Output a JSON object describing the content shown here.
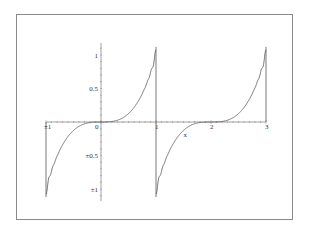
{
  "chart_data": {
    "type": "line",
    "title": "",
    "xlabel": "x",
    "ylabel": "",
    "xlim": [
      -1,
      3
    ],
    "ylim": [
      -1.15,
      1.15
    ],
    "grid": false,
    "legend": null,
    "x_ticks": [
      {
        "value": -1,
        "label": "±1"
      },
      {
        "value": 0,
        "label": "0"
      },
      {
        "value": 1,
        "label": "1"
      },
      {
        "value": 2,
        "label": "2"
      },
      {
        "value": 3,
        "label": "3"
      }
    ],
    "y_ticks": [
      {
        "value": 1,
        "label": "1"
      },
      {
        "value": 0.5,
        "label": "0.5"
      },
      {
        "value": -0.5,
        "label": "±0.5"
      },
      {
        "value": -1,
        "label": "±1"
      }
    ],
    "series": [
      {
        "name": "Fourier approximation of periodic x^3 (period 2)",
        "color": "#555555",
        "description": "Periodic extension of f(x)=x^3 on [-1,1) with Gibbs overshoot near odd integers",
        "x": [
          -1.0,
          -0.9,
          -0.8,
          -0.7,
          -0.6,
          -0.5,
          -0.4,
          -0.3,
          -0.2,
          -0.1,
          0.0,
          0.1,
          0.2,
          0.3,
          0.4,
          0.5,
          0.6,
          0.7,
          0.8,
          0.9,
          1.0,
          1.1,
          1.2,
          1.3,
          1.4,
          1.5,
          1.6,
          1.7,
          1.8,
          1.9,
          2.0,
          2.1,
          2.2,
          2.3,
          2.4,
          2.5,
          2.6,
          2.7,
          2.8,
          2.9,
          3.0
        ],
        "y": [
          0.0,
          -0.73,
          -0.51,
          -0.34,
          -0.22,
          -0.125,
          -0.064,
          -0.027,
          -0.008,
          -0.001,
          0.0,
          0.001,
          0.008,
          0.027,
          0.064,
          0.125,
          0.216,
          0.343,
          0.512,
          0.729,
          0.0,
          -0.73,
          -0.51,
          -0.34,
          -0.22,
          -0.125,
          -0.064,
          -0.027,
          -0.008,
          -0.001,
          0.0,
          0.001,
          0.008,
          0.027,
          0.064,
          0.125,
          0.216,
          0.343,
          0.512,
          0.729,
          0.0
        ],
        "overshoot_peaks": [
          {
            "x": -0.98,
            "y": -1.1
          },
          {
            "x": 0.98,
            "y": 1.1
          },
          {
            "x": 1.02,
            "y": -1.1
          },
          {
            "x": 2.98,
            "y": 1.1
          }
        ]
      }
    ]
  }
}
